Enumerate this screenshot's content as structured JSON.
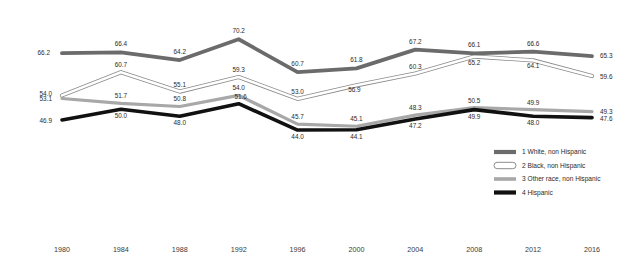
{
  "chart_data": {
    "type": "line",
    "title": "",
    "subtitle": "",
    "xlabel": "",
    "ylabel": "",
    "grid": false,
    "legend_position": "right-middle",
    "xlim": [
      1980,
      2016
    ],
    "ylim": [
      42,
      72
    ],
    "categories": [
      1980,
      1984,
      1988,
      1992,
      1996,
      2000,
      2004,
      2008,
      2012,
      2016
    ],
    "x_tick_labels": [
      "1980",
      "1984",
      "1988",
      "1992",
      "1996",
      "2000",
      "2004",
      "2008",
      "2012",
      "2016"
    ],
    "series": [
      {
        "name": "1 White, non Hispanic",
        "legend_number": "1",
        "color": "#6b6b6b",
        "style": "thick-dark-gray",
        "values": [
          66.2,
          66.4,
          64.2,
          70.2,
          60.7,
          61.8,
          67.2,
          66.1,
          66.6,
          65.3
        ],
        "labels": [
          "66.2",
          "66.4",
          "64.2",
          "70.2",
          "60.7",
          "61.8",
          "67.2",
          "66.1",
          "66.6",
          "65.3"
        ]
      },
      {
        "name": "2 Black, non Hispanic",
        "legend_number": "2",
        "color": "#ffffff",
        "style": "white-outlined",
        "values": [
          54.0,
          60.7,
          55.1,
          59.3,
          53.0,
          56.9,
          60.3,
          65.2,
          64.1,
          59.6
        ],
        "labels": [
          "54.0",
          "60.7",
          "55.1",
          "59.3",
          "53.0",
          "56.9",
          "60.3",
          "65.2",
          "64.1",
          "59.6"
        ]
      },
      {
        "name": "3 Other race, non Hispanic",
        "legend_number": "3",
        "color": "#a8a8a8",
        "style": "medium-gray",
        "values": [
          53.1,
          51.7,
          50.8,
          54.0,
          45.7,
          45.1,
          48.3,
          50.5,
          49.9,
          49.3
        ],
        "labels": [
          "53.1",
          "51.7",
          "50.8",
          "54.0",
          "45.7",
          "45.1",
          "48.3",
          "50.5",
          "49.9",
          "49.3"
        ]
      },
      {
        "name": "4 Hispanic",
        "legend_number": "4",
        "color": "#111111",
        "style": "thick-black",
        "values": [
          46.9,
          50.0,
          48.0,
          51.6,
          44.0,
          44.1,
          47.2,
          49.9,
          48.0,
          47.6
        ],
        "labels": [
          "46.9",
          "50.0",
          "48.0",
          "51.6",
          "44.0",
          "44.1",
          "47.2",
          "49.9",
          "48.0",
          "47.6"
        ]
      }
    ]
  },
  "legend": {
    "items": [
      {
        "label": "1 White, non Hispanic"
      },
      {
        "label": "2 Black, non Hispanic"
      },
      {
        "label": "3 Other race, non Hispanic"
      },
      {
        "label": "4 Hispanic"
      }
    ]
  },
  "axis": {
    "x_labels": [
      "1980",
      "1984",
      "1988",
      "1992",
      "1996",
      "2000",
      "2004",
      "2008",
      "2012",
      "2016"
    ]
  },
  "colors": {
    "white_series": "#6b6b6b",
    "black_series": "#ffffff",
    "other_series": "#a8a8a8",
    "hispanic_series": "#111111",
    "background": "#ffffff",
    "text": "#231f20"
  }
}
